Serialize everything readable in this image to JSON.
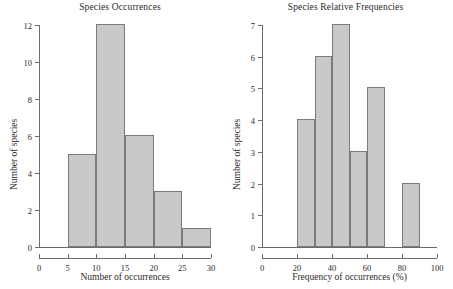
{
  "figure": {
    "background": "#ffffff",
    "bar_fill": "#c9c9c9",
    "bar_stroke": "#7d7b79",
    "axis_color": "#6e6b69"
  },
  "panels": [
    {
      "title": "Species Occurrences",
      "xlabel": "Number of occurrences",
      "ylabel": "Number of species"
    },
    {
      "title": "Species Relative Frequencies",
      "xlabel": "Frequency of occurrences  (%)",
      "ylabel": "Number of species"
    }
  ],
  "chart_data": [
    {
      "type": "bar",
      "title": "Species Occurrences",
      "xlabel": "Number of occurrences",
      "ylabel": "Number of species",
      "xlim": [
        0,
        30
      ],
      "ylim": [
        0,
        12
      ],
      "xticks": [
        0,
        5,
        10,
        15,
        20,
        25,
        30
      ],
      "xtick_labels": [
        "0",
        "5",
        "10",
        "15",
        "20",
        "25",
        "30"
      ],
      "yticks": [
        0,
        2,
        4,
        6,
        8,
        10,
        12
      ],
      "ytick_labels": [
        "0",
        "2",
        "4",
        "6",
        "8",
        "10",
        "12"
      ],
      "grid": false,
      "legend": null,
      "bin_width": 5,
      "bins": [
        {
          "x0": 5,
          "x1": 10,
          "value": 5
        },
        {
          "x0": 10,
          "x1": 15,
          "value": 12
        },
        {
          "x0": 15,
          "x1": 20,
          "value": 6
        },
        {
          "x0": 20,
          "x1": 25,
          "value": 3
        },
        {
          "x0": 25,
          "x1": 30,
          "value": 1
        }
      ],
      "categories": [
        "5-10",
        "10-15",
        "15-20",
        "20-25",
        "25-30"
      ],
      "values": [
        5,
        12,
        6,
        3,
        1
      ]
    },
    {
      "type": "bar",
      "title": "Species Relative Frequencies",
      "xlabel": "Frequency of occurrences  (%)",
      "ylabel": "Number of species",
      "xlim": [
        0,
        100
      ],
      "ylim": [
        0,
        7
      ],
      "xticks": [
        0,
        20,
        40,
        60,
        80,
        100
      ],
      "xtick_labels": [
        "0",
        "20",
        "40",
        "60",
        "80",
        "100"
      ],
      "yticks": [
        0,
        1,
        2,
        3,
        4,
        5,
        6,
        7
      ],
      "ytick_labels": [
        "0",
        "1",
        "2",
        "3",
        "4",
        "5",
        "6",
        "7"
      ],
      "grid": false,
      "legend": null,
      "bin_width": 10,
      "bins": [
        {
          "x0": 20,
          "x1": 30,
          "value": 4
        },
        {
          "x0": 30,
          "x1": 40,
          "value": 6
        },
        {
          "x0": 40,
          "x1": 50,
          "value": 7
        },
        {
          "x0": 50,
          "x1": 60,
          "value": 3
        },
        {
          "x0": 60,
          "x1": 70,
          "value": 5
        },
        {
          "x0": 70,
          "x1": 80,
          "value": 0
        },
        {
          "x0": 80,
          "x1": 90,
          "value": 2
        }
      ],
      "categories": [
        "20-30",
        "30-40",
        "40-50",
        "50-60",
        "60-70",
        "70-80",
        "80-90"
      ],
      "values": [
        4,
        6,
        7,
        3,
        5,
        0,
        2
      ]
    }
  ]
}
